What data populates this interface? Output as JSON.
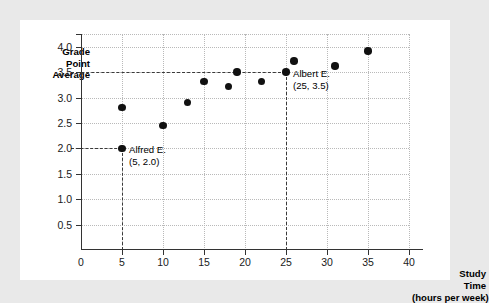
{
  "chart_data": {
    "type": "scatter",
    "title": "",
    "xlabel": "Study Time (hours per week)",
    "ylabel": "Grade Point Average",
    "xlim": [
      0,
      40
    ],
    "ylim": [
      0,
      4.25
    ],
    "grid": true,
    "legend": "none",
    "x_ticks": [
      "0",
      "5",
      "10",
      "15",
      "20",
      "25",
      "30",
      "35",
      "40"
    ],
    "x_tick_values": [
      0,
      5,
      10,
      15,
      20,
      25,
      30,
      35,
      40
    ],
    "y_ticks": [
      "0.5",
      "1.0",
      "1.5",
      "2.0",
      "2.5",
      "3.0",
      "3.5",
      "4.0"
    ],
    "y_tick_values": [
      0.5,
      1.0,
      1.5,
      2.0,
      2.5,
      3.0,
      3.5,
      4.0
    ],
    "origin_label": "0",
    "points": [
      {
        "x": 5,
        "y": 2.0
      },
      {
        "x": 5,
        "y": 2.8
      },
      {
        "x": 10,
        "y": 2.45
      },
      {
        "x": 13,
        "y": 2.9
      },
      {
        "x": 15,
        "y": 3.32
      },
      {
        "x": 18,
        "y": 3.22
      },
      {
        "x": 19,
        "y": 3.5
      },
      {
        "x": 22,
        "y": 3.32
      },
      {
        "x": 25,
        "y": 3.5
      },
      {
        "x": 26,
        "y": 3.72
      },
      {
        "x": 31,
        "y": 3.62
      },
      {
        "x": 35,
        "y": 3.92
      }
    ],
    "annotations": [
      {
        "name": "Alfred E.",
        "coords": "(5, 2.0)",
        "x": 5,
        "y": 2.0
      },
      {
        "name": "Albert E.",
        "coords": "(25, 3.5)",
        "x": 25,
        "y": 3.5
      }
    ],
    "reference_lines": [
      {
        "orientation": "horizontal",
        "value": 2.0,
        "style": "dashed"
      },
      {
        "orientation": "horizontal",
        "value": 3.5,
        "style": "dashed"
      },
      {
        "orientation": "vertical",
        "value": 5,
        "style": "dashed"
      },
      {
        "orientation": "vertical",
        "value": 25,
        "style": "dashed"
      }
    ],
    "colors": {
      "point": "#111111",
      "axis": "#333333",
      "gridline": "#b9b9b9",
      "reference_line": "#3a3a3a",
      "panel_background": "#ffffff",
      "page_background": "#e9e9e9"
    }
  },
  "axes": {
    "y_title_lines": [
      "Grade",
      "Point",
      "Average"
    ],
    "x_title_lines": [
      "Study",
      "Time",
      "(hours per week)"
    ]
  }
}
